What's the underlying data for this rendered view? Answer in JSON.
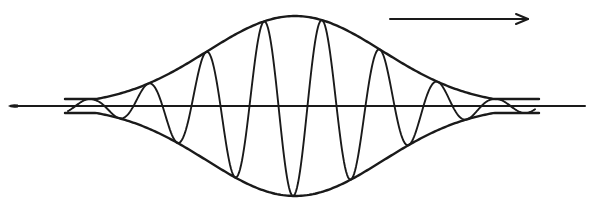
{
  "diagram": {
    "title": "",
    "type": "wave-packet",
    "colors": {
      "ink": "#1a1a1a",
      "background": "#ffffff"
    },
    "axis": {
      "x_start": 8,
      "x_end": 585,
      "y": 106
    },
    "envelope": {
      "center_x": 295,
      "peak_amplitude": 90,
      "sigma": 88,
      "x_start": 65,
      "x_end": 540,
      "end_gap": 7
    },
    "carrier": {
      "x_start": 68,
      "x_end": 535,
      "wavelength": 58,
      "phase_offset": 322
    },
    "direction_arrow": {
      "label": "",
      "x_start": 390,
      "x_end": 528,
      "y": 19,
      "direction": "right"
    }
  }
}
